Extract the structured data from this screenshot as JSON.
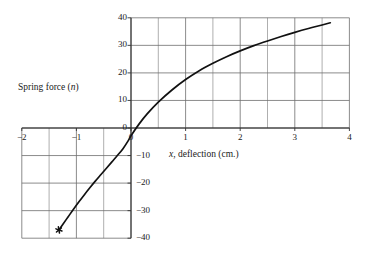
{
  "figure": {
    "axis_titles": {
      "y_prefix": "Spring force (",
      "y_italic": "n",
      "y_suffix": ")",
      "x_italic": "x",
      "x_rest": ", deflection (cm.)"
    }
  },
  "chart_data": {
    "type": "line",
    "title": "",
    "xlabel": "x, deflection (cm.)",
    "ylabel": "Spring force (n)",
    "xlim": [
      -2,
      4
    ],
    "ylim": [
      -40,
      40
    ],
    "grid": true,
    "legend": "none",
    "x_ticks": [
      -2,
      -1,
      0,
      1,
      2,
      3,
      4
    ],
    "x_tick_labels": [
      "−2",
      "−1",
      "0",
      "1",
      "2",
      "3",
      "4"
    ],
    "y_ticks": [
      -40,
      -30,
      -20,
      -10,
      0,
      10,
      20,
      30,
      40
    ],
    "y_tick_labels": [
      "−40",
      "−30",
      "−20",
      "−10",
      "0",
      "10",
      "20",
      "30",
      "40"
    ],
    "x_minor_step": 0.5,
    "y_minor_step": 10,
    "series": [
      {
        "name": "spring force curve",
        "marker_points": [
          {
            "x": -1.32,
            "y": -37.0
          }
        ],
        "x": [
          -1.32,
          -1.25,
          -1.15,
          -1.05,
          -0.95,
          -0.85,
          -0.75,
          -0.65,
          -0.55,
          -0.45,
          -0.35,
          -0.25,
          -0.15,
          -0.05,
          0.0,
          0.15,
          0.3,
          0.5,
          0.75,
          1.0,
          1.25,
          1.5,
          1.75,
          2.0,
          2.25,
          2.5,
          2.75,
          3.0,
          3.25,
          3.5,
          3.65
        ],
        "y": [
          -37.0,
          -35.0,
          -32.2,
          -29.4,
          -26.7,
          -24.1,
          -21.6,
          -19.2,
          -16.9,
          -14.6,
          -12.3,
          -10.0,
          -7.6,
          -4.6,
          -2.8,
          1.5,
          5.2,
          9.4,
          13.8,
          17.6,
          20.8,
          23.5,
          25.9,
          28.0,
          29.9,
          31.6,
          33.2,
          34.7,
          36.1,
          37.4,
          38.2
        ]
      }
    ]
  }
}
